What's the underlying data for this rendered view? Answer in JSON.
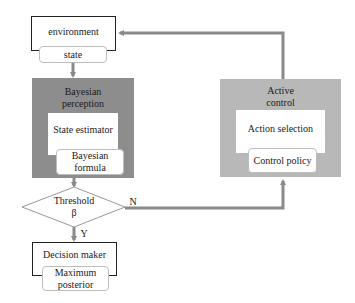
{
  "nodes": {
    "environment": {
      "label": "environment",
      "sub": "state"
    },
    "bayesian_perception": {
      "title_line1": "Bayesian",
      "title_line2": "perception",
      "inner": "State estimator",
      "sub_line1": "Bayesian",
      "sub_line2": "formula"
    },
    "threshold": {
      "line1": "Threshold",
      "line2": "β"
    },
    "decision_maker": {
      "label": "Decision maker",
      "sub_line1": "Maximum",
      "sub_line2": "posterior"
    },
    "active_control": {
      "title_line1": "Active",
      "title_line2": "control",
      "inner": "Action selection",
      "sub": "Control policy"
    }
  },
  "edges": {
    "yes_label": "Y",
    "no_label": "N"
  },
  "colors": {
    "perception_fill": "#8d8d8d",
    "control_fill": "#b8b8b8",
    "arrow": "#8a8a8a"
  }
}
